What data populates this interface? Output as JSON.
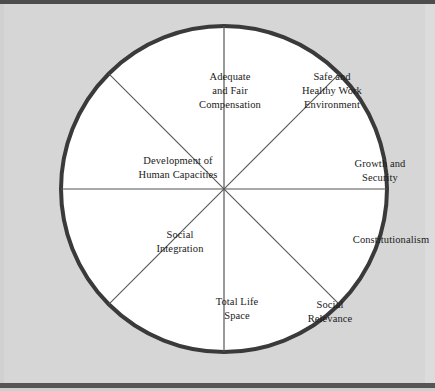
{
  "figure": {
    "shape": "circle",
    "sector_count": 8,
    "background_color": "#d6d6d6",
    "sector_fill_color": "#ffffff",
    "outer_ring_color": "#3a3a3a",
    "divider_color": "#555555",
    "text_color": "#1a1a1a"
  },
  "sectors": [
    {
      "id": "adequate-fair-compensation",
      "label": "Adequate\nand Fair\nCompensation",
      "position": "top-left-upper"
    },
    {
      "id": "safe-healthy-work-environment",
      "label": "Safe and\nHealthy Work\nEnvironment",
      "position": "top-right-upper"
    },
    {
      "id": "development-human-capacities",
      "label": "Development of\nHuman Capacities",
      "position": "left-upper"
    },
    {
      "id": "growth-security",
      "label": "Growth and\nSecurity",
      "position": "right-upper"
    },
    {
      "id": "social-integration",
      "label": "Social\nIntegration",
      "position": "left-lower"
    },
    {
      "id": "constitutionalism",
      "label": "Constitutionalism",
      "position": "right-lower"
    },
    {
      "id": "total-life-space",
      "label": "Total Life\nSpace",
      "position": "bottom-left-lower"
    },
    {
      "id": "social-relevance",
      "label": "Social\nRelevance",
      "position": "bottom-right-lower"
    }
  ]
}
